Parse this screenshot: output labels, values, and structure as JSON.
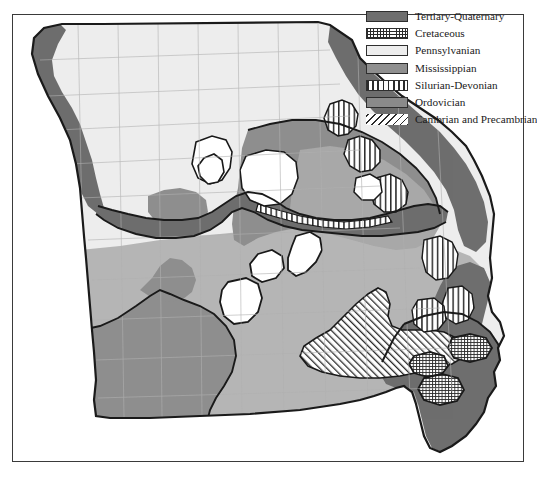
{
  "map": {
    "title": "Geologic map of Missouri",
    "subject": "Missouri bedrock geology",
    "background_color": "#ffffff",
    "frame_color": "#3a3a3a",
    "outline_color": "#1a1a1a",
    "county_line_color": "#b0b0b0"
  },
  "legend": {
    "position": "top-right",
    "items": [
      {
        "label": "Tertiary-Quaternary",
        "swatch": "solid-dark-gray",
        "color": "#6e6e6e",
        "pattern": "solid"
      },
      {
        "label": "Cretaceous",
        "swatch": "grid-crosshatch",
        "color": "#2b2b2b",
        "pattern": "grid"
      },
      {
        "label": "Pennsylvanian",
        "swatch": "solid-very-light",
        "color": "#ededed",
        "pattern": "solid"
      },
      {
        "label": "Mississippian",
        "swatch": "solid-medium-gray",
        "color": "#8f8f8f",
        "pattern": "solid"
      },
      {
        "label": "Silurian-Devonian",
        "swatch": "vertical-lines",
        "color": "#2b2b2b",
        "pattern": "vertical"
      },
      {
        "label": "Ordovician",
        "swatch": "solid-medium-gray",
        "color": "#8a8a8a",
        "pattern": "solid"
      },
      {
        "label": "Cambrian and Precambrian",
        "swatch": "diagonal-hatch",
        "color": "#2b2b2b",
        "pattern": "diagonal"
      }
    ]
  },
  "regions": {
    "northwest": "Pennsylvanian",
    "river_corridors": "Tertiary-Quaternary",
    "central_south": "Ordovician",
    "southwest": "Mississippian",
    "st_francois_mountains": "Cambrian and Precambrian",
    "northeast_river_patches": "Silurian-Devonian",
    "bootheel": "Tertiary-Quaternary",
    "bootheel_patches": "Cretaceous"
  }
}
